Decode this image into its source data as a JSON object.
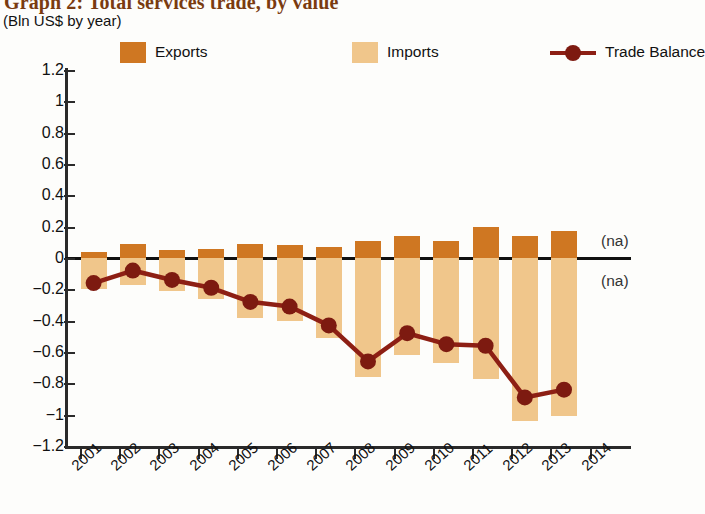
{
  "header": {
    "title": "Graph 2: Total services trade, by value",
    "subtitle": "(Bln US$ by year)"
  },
  "legend": [
    {
      "label": "Exports",
      "type": "swatch",
      "color": "#cf7722"
    },
    {
      "label": "Imports",
      "type": "swatch",
      "color": "#f0c68b"
    },
    {
      "label": "Trade Balance",
      "type": "line",
      "color": "#8d1f14"
    }
  ],
  "annotations": [
    {
      "text": "(na)",
      "x": 601,
      "y": 232
    },
    {
      "text": "(na)",
      "x": 601,
      "y": 272
    }
  ],
  "colors": {
    "exports": "#cf7722",
    "imports": "#f0c68b",
    "balance": "#8d1f14",
    "title": "#7a3b10",
    "axis": "#2a2a2a"
  },
  "chart_data": {
    "type": "bar",
    "title": "Graph 2: Total services trade, by value",
    "subtitle": "(Bln US$ by year)",
    "xlabel": "",
    "ylabel": "Bln US$",
    "ylim": [
      -1.2,
      1.2
    ],
    "yticks": [
      1.2,
      1,
      0.8,
      0.6,
      0.4,
      0.2,
      0,
      -0.2,
      -0.4,
      -0.6,
      -0.8,
      -1,
      -1.2
    ],
    "ytick_labels": [
      "1.2",
      "1",
      "0.8",
      "0.6",
      "0.4",
      "0.2",
      "0",
      "-0.2",
      "-0.4",
      "-0.6",
      "-0.8",
      "-1",
      "-1.2"
    ],
    "categories": [
      "2001",
      "2002",
      "2003",
      "2004",
      "2005",
      "2006",
      "2007",
      "2008",
      "2009",
      "2010",
      "2011",
      "2012",
      "2013",
      "2014"
    ],
    "grid": false,
    "legend_position": "top",
    "series": [
      {
        "name": "Exports",
        "type": "bar",
        "color": "#cf7722",
        "values": [
          0.04,
          0.09,
          0.05,
          0.06,
          0.09,
          0.08,
          0.07,
          0.11,
          0.14,
          0.11,
          0.2,
          0.14,
          0.17,
          null
        ]
      },
      {
        "name": "Imports",
        "type": "bar",
        "color": "#f0c68b",
        "values": [
          -0.2,
          -0.17,
          -0.21,
          -0.26,
          -0.38,
          -0.4,
          -0.51,
          -0.76,
          -0.62,
          -0.67,
          -0.77,
          -1.04,
          -1.01,
          null
        ]
      },
      {
        "name": "Trade Balance",
        "type": "line",
        "color": "#8d1f14",
        "values": [
          -0.16,
          -0.08,
          -0.14,
          -0.19,
          -0.28,
          -0.31,
          -0.43,
          -0.66,
          -0.48,
          -0.55,
          -0.56,
          -0.89,
          -0.84,
          null
        ]
      }
    ]
  }
}
